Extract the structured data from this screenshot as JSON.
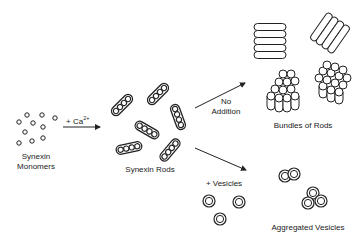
{
  "diagram": {
    "nodes": {
      "monomers": {
        "label_line1": "Synexin",
        "label_line2": "Monomers"
      },
      "rods": {
        "label": "Synexin Rods"
      },
      "bundles": {
        "label": "Bundles of Rods"
      },
      "aggregated": {
        "label": "Aggregated Vesicles"
      }
    },
    "edges": {
      "calcium": {
        "label_prefix": "+ Ca",
        "label_sup": "2+"
      },
      "no_addition": {
        "label_line1": "No",
        "label_line2": "Addition"
      },
      "vesicles": {
        "label": "+ Vesicles"
      }
    },
    "colors": {
      "stroke": "#222222",
      "background": "#ffffff"
    }
  }
}
